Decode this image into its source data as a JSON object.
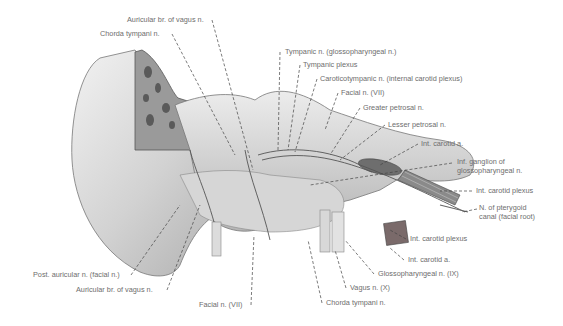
{
  "figure": {
    "labels": [
      {
        "id": "auricular-br-vagus-top",
        "text": "Auricular br. of vagus n.",
        "x": 127,
        "y": 16
      },
      {
        "id": "chorda-tympani-top",
        "text": "Chorda tympani n.",
        "x": 100,
        "y": 30
      },
      {
        "id": "tympanic-n",
        "text": "Tympanic n. (glossopharyngeal n.)",
        "x": 285,
        "y": 48
      },
      {
        "id": "tympanic-plexus",
        "text": "Tympanic plexus",
        "x": 303,
        "y": 61
      },
      {
        "id": "caroticotympanic-n",
        "text": "Caroticotympanic n. (internal carotid plexus)",
        "x": 320,
        "y": 75
      },
      {
        "id": "facial-n-top",
        "text": "Facial n. (VII)",
        "x": 341,
        "y": 89
      },
      {
        "id": "greater-petrosal-n",
        "text": "Greater petrosal n.",
        "x": 363,
        "y": 104
      },
      {
        "id": "lesser-petrosal-n",
        "text": "Lesser petrosal n.",
        "x": 388,
        "y": 121
      },
      {
        "id": "int-carotid-a-top",
        "text": "Int. carotid a.",
        "x": 421,
        "y": 140
      },
      {
        "id": "inf-ganglion",
        "text": "Inf. ganglion of",
        "text2": "glossopharyngeal n.",
        "x": 457,
        "y": 160
      },
      {
        "id": "int-carotid-plexus-right",
        "text": "Int. carotid plexus",
        "x": 476,
        "y": 187
      },
      {
        "id": "n-pterygoid-canal",
        "text": "N. of pterygoid",
        "text2": "canal (facial root)",
        "x": 479,
        "y": 205
      },
      {
        "id": "int-carotid-plexus-bottom",
        "text": "Int. carotid plexus",
        "x": 410,
        "y": 235
      },
      {
        "id": "int-carotid-a-bottom",
        "text": "Int. carotid a.",
        "x": 408,
        "y": 256
      },
      {
        "id": "glossopharyngeal-n",
        "text": "Glossopharyngeal n. (IX)",
        "x": 378,
        "y": 270
      },
      {
        "id": "vagus-n",
        "text": "Vagus n. (X)",
        "x": 350,
        "y": 284
      },
      {
        "id": "chorda-tympani-bottom",
        "text": "Chorda tympani n.",
        "x": 326,
        "y": 299
      },
      {
        "id": "post-auricular-n",
        "text": "Post. auricular n. (facial n.)",
        "x": 33,
        "y": 271
      },
      {
        "id": "auricular-br-vagus-bottom",
        "text": "Auricular br. of vagus n.",
        "x": 76,
        "y": 286
      },
      {
        "id": "facial-n-bottom",
        "text": "Facial n. (VII)",
        "x": 199,
        "y": 301
      }
    ],
    "colors": {
      "background": "#ffffff",
      "label_text": "#6e6e6e",
      "bone_light": "#e4e4e4",
      "bone_mid": "#bdbdbd",
      "bone_dark": "#7a7a7a",
      "leader_line": "#444444"
    }
  }
}
